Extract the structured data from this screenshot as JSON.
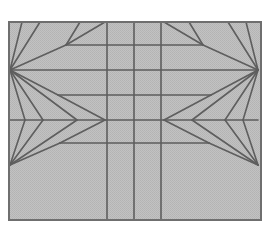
{
  "diagram": {
    "kind": "origami-crease-pattern",
    "colors": {
      "page_background": "#ffffff",
      "paper_fill": "#bdbdbd",
      "paper_border": "#6f6f6f",
      "crease_line": "#5e5e5e"
    },
    "frame": {
      "x": 9,
      "y": 22,
      "width": 252,
      "height": 198
    },
    "vertical_creases_x": [
      107,
      134,
      161
    ],
    "horizontal_creases": [
      {
        "y": 45,
        "x1": 66,
        "x2": 203
      },
      {
        "y": 70,
        "x1": 10,
        "x2": 258
      },
      {
        "y": 95,
        "x1": 58,
        "x2": 211
      },
      {
        "y": 120,
        "x1": 10,
        "x2": 258
      },
      {
        "y": 143,
        "x1": 60,
        "x2": 209
      }
    ],
    "focal_points": {
      "left_upper": [
        10,
        70
      ],
      "left_lower": [
        10,
        165
      ],
      "right_upper": [
        258,
        70
      ],
      "right_lower": [
        258,
        165
      ]
    },
    "diagonal_creases": [
      [
        10,
        70,
        22,
        22
      ],
      [
        10,
        70,
        40,
        22
      ],
      [
        10,
        70,
        66,
        45
      ],
      [
        66,
        45,
        80,
        22
      ],
      [
        66,
        45,
        105,
        22
      ],
      [
        10,
        70,
        58,
        95
      ],
      [
        58,
        95,
        105,
        120
      ],
      [
        10,
        70,
        25,
        120
      ],
      [
        10,
        70,
        43,
        120
      ],
      [
        10,
        70,
        77,
        120
      ],
      [
        10,
        165,
        25,
        120
      ],
      [
        10,
        165,
        43,
        120
      ],
      [
        10,
        165,
        77,
        120
      ],
      [
        10,
        165,
        60,
        143
      ],
      [
        60,
        143,
        105,
        120
      ],
      [
        258,
        70,
        246,
        22
      ],
      [
        258,
        70,
        228,
        22
      ],
      [
        258,
        70,
        203,
        45
      ],
      [
        203,
        45,
        189,
        22
      ],
      [
        203,
        45,
        164,
        22
      ],
      [
        258,
        70,
        211,
        95
      ],
      [
        211,
        95,
        164,
        120
      ],
      [
        258,
        70,
        243,
        120
      ],
      [
        258,
        70,
        225,
        120
      ],
      [
        258,
        70,
        192,
        120
      ],
      [
        258,
        165,
        243,
        120
      ],
      [
        258,
        165,
        225,
        120
      ],
      [
        258,
        165,
        192,
        120
      ],
      [
        258,
        165,
        209,
        143
      ],
      [
        209,
        143,
        164,
        120
      ]
    ]
  }
}
